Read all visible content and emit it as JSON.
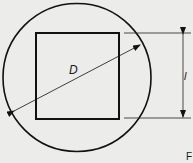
{
  "diagram": {
    "labels": {
      "diameter": "D",
      "side_length": "l",
      "corner_mark": "F"
    },
    "shapes": {
      "circle": {
        "cx": 77,
        "cy": 77.5,
        "r": 74,
        "stroke": "#111111"
      },
      "square": {
        "x": 36,
        "y": 33,
        "width": 83,
        "height": 86,
        "stroke": "#111111"
      }
    },
    "dimension_lines": {
      "diameter_arrow": {
        "from": [
          14,
          111
        ],
        "to": [
          140,
          45
        ]
      },
      "vertical_dimension": {
        "x": 183,
        "top": 33,
        "bottom": 118
      },
      "extension_top": {
        "x1": 124,
        "x2": 191,
        "y": 33
      },
      "extension_bottom": {
        "x1": 124,
        "x2": 191,
        "y": 118
      }
    },
    "colors": {
      "background": "#ececea",
      "line": "#111111"
    }
  }
}
